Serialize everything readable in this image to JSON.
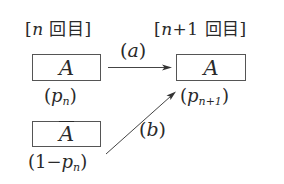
{
  "diagram": {
    "headers": {
      "left": {
        "open": "[",
        "var": "n",
        "text": " 回目",
        "close": "]"
      },
      "right": {
        "open": "[",
        "var": "n",
        "plus": "+1",
        "text": " 回目",
        "close": "]"
      }
    },
    "boxes": {
      "left_top": "A",
      "left_bottom": "A",
      "right": "A"
    },
    "probabilities": {
      "left_top": {
        "open": "(",
        "var": "p",
        "sub": "n",
        "close": ")"
      },
      "left_bottom": {
        "prefix": "(1−",
        "var": "p",
        "sub": "n",
        "close": ")"
      },
      "right": {
        "open": "(",
        "var": "p",
        "sub": "n+1",
        "close": ")"
      }
    },
    "transitions": {
      "a": {
        "open": "(",
        "var": "a",
        "close": ")"
      },
      "b": {
        "open": "(",
        "var": "b",
        "close": ")"
      }
    },
    "colors": {
      "stroke": "#555555",
      "text": "#2a2a2a"
    }
  }
}
